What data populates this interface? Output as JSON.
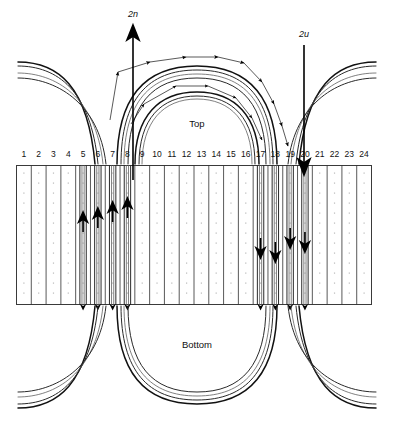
{
  "figure": {
    "type": "stator-winding-development-diagram",
    "top_label": "Top",
    "bottom_label": "Bottom",
    "terminals": [
      {
        "id": "2n",
        "label": "2n",
        "direction": "up",
        "arrow_icon": "arrow-up-icon"
      },
      {
        "id": "2u",
        "label": "2u",
        "direction": "down",
        "arrow_icon": "arrow-down-icon"
      }
    ],
    "slot_numbers": [
      "1",
      "2",
      "3",
      "4",
      "5",
      "6",
      "7",
      "8",
      "9",
      "10",
      "11",
      "12",
      "13",
      "14",
      "15",
      "16",
      "17",
      "18",
      "19",
      "20",
      "21",
      "22",
      "23",
      "24"
    ],
    "slot_count": 24,
    "conductor_arrows": {
      "upward_slots": [
        5,
        6,
        7,
        8
      ],
      "downward_slots": [
        17,
        18,
        19,
        20
      ]
    },
    "colors": {
      "background": "#ffffff",
      "outline": "#3a3a3a",
      "conductor": "#2a2a2a",
      "arrow": "#000000",
      "hatch": "#b9b9b9",
      "text": "#111111"
    }
  }
}
